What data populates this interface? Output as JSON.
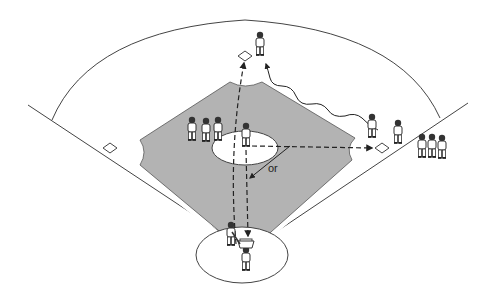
{
  "diagram": {
    "labels": {
      "or": "or"
    },
    "colors": {
      "infield": "#b3b3b3",
      "line": "#333333",
      "background": "#ffffff"
    },
    "elements": {
      "bases": [
        "second-base",
        "first-base",
        "third-base",
        "home-plate"
      ],
      "players": {
        "second_base_fielder": 1,
        "pitcher": 1,
        "catcher": 1,
        "batter": 1,
        "runner": 1,
        "first_base_fielder": 1,
        "infield_waiting_group": 3,
        "right_side_waiting_group": 3
      },
      "paths": [
        {
          "name": "throw-home-to-second",
          "style": "dashed",
          "from": "home",
          "to": "second-base"
        },
        {
          "name": "throw-mound-to-home",
          "style": "dashed",
          "from": "pitcher",
          "to": "home"
        },
        {
          "name": "throw-mound-to-first",
          "style": "dashed",
          "from": "pitcher",
          "to": "first-base"
        },
        {
          "name": "runner-path",
          "style": "wavy",
          "from": "first-base",
          "to": "second-base"
        },
        {
          "name": "alternate-throw",
          "style": "solid",
          "label": "or"
        }
      ]
    }
  }
}
